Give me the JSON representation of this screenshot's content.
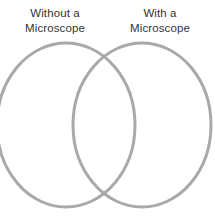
{
  "diagram": {
    "type": "venn",
    "background_color": "#ffffff",
    "title": "",
    "sets": [
      {
        "id": "left",
        "label": "Without a\nMicroscope",
        "label_line_1": "Without a",
        "label_line_2": "Microscope",
        "stroke_color": "#a9a9a9",
        "fill": "none",
        "center_x": 66,
        "center_y": 125,
        "radius_x": 69,
        "radius_y": 82
      },
      {
        "id": "right",
        "label": "With a\nMicroscope",
        "label_line_1": "With a",
        "label_line_2": "Microscope",
        "stroke_color": "#a9a9a9",
        "fill": "none",
        "center_x": 142,
        "center_y": 125,
        "radius_x": 69,
        "radius_y": 82
      }
    ],
    "stroke_width": 3,
    "text_color": "#333333",
    "intersection_points": [
      {
        "x": 107,
        "y": 58
      },
      {
        "x": 107,
        "y": 192
      }
    ]
  }
}
